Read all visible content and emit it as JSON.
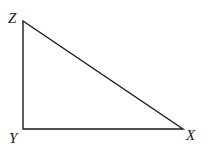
{
  "diagram": {
    "type": "right-triangle",
    "vertices": [
      {
        "id": "Z",
        "label": "Z",
        "x": 23,
        "y": 21,
        "label_x": 8,
        "label_y": 23
      },
      {
        "id": "Y",
        "label": "Y",
        "x": 23,
        "y": 129,
        "label_x": 9,
        "label_y": 143
      },
      {
        "id": "X",
        "label": "X",
        "x": 183,
        "y": 129,
        "label_x": 186,
        "label_y": 140
      }
    ],
    "edges": [
      {
        "from": "Z",
        "to": "Y"
      },
      {
        "from": "Y",
        "to": "X"
      },
      {
        "from": "X",
        "to": "Z"
      }
    ],
    "right_angle_at": "Y",
    "stroke_color": "#1a1a1a"
  }
}
